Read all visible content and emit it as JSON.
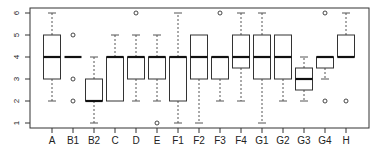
{
  "chart_data": {
    "type": "boxplot",
    "title": "",
    "xlabel": "",
    "ylabel": "",
    "ylim": [
      1,
      6
    ],
    "yticks": [
      1,
      2,
      3,
      4,
      5,
      6
    ],
    "grid": false,
    "legend": null,
    "categories": [
      "A",
      "B1",
      "B2",
      "C",
      "D",
      "E",
      "F1",
      "F2",
      "F3",
      "F4",
      "G1",
      "G2",
      "G3",
      "G4",
      "H"
    ],
    "boxes": [
      {
        "label": "A",
        "whisker_low": 2,
        "q1": 3,
        "median": 4,
        "q3": 5,
        "whisker_high": 6,
        "outliers": []
      },
      {
        "label": "B1",
        "whisker_low": 4,
        "q1": 4,
        "median": 4,
        "q3": 4,
        "whisker_high": 4,
        "outliers": [
          5,
          3,
          2
        ]
      },
      {
        "label": "B2",
        "whisker_low": 1,
        "q1": 2,
        "median": 2,
        "q3": 3,
        "whisker_high": 4,
        "outliers": []
      },
      {
        "label": "C",
        "whisker_low": 2,
        "q1": 2,
        "median": 4,
        "q3": 4,
        "whisker_high": 5,
        "outliers": []
      },
      {
        "label": "D",
        "whisker_low": 2,
        "q1": 3,
        "median": 4,
        "q3": 4,
        "whisker_high": 5,
        "outliers": [
          6
        ]
      },
      {
        "label": "E",
        "whisker_low": 2,
        "q1": 3,
        "median": 4,
        "q3": 4,
        "whisker_high": 5,
        "outliers": [
          1
        ]
      },
      {
        "label": "F1",
        "whisker_low": 1,
        "q1": 2,
        "median": 4,
        "q3": 4,
        "whisker_high": 6,
        "outliers": []
      },
      {
        "label": "F2",
        "whisker_low": 1,
        "q1": 3,
        "median": 4,
        "q3": 5,
        "whisker_high": 5,
        "outliers": []
      },
      {
        "label": "F3",
        "whisker_low": 2,
        "q1": 3,
        "median": 4,
        "q3": 4,
        "whisker_high": 4,
        "outliers": [
          6
        ]
      },
      {
        "label": "F4",
        "whisker_low": 2,
        "q1": 3.5,
        "median": 4,
        "q3": 5,
        "whisker_high": 6,
        "outliers": []
      },
      {
        "label": "G1",
        "whisker_low": 1,
        "q1": 3,
        "median": 4,
        "q3": 5,
        "whisker_high": 6,
        "outliers": []
      },
      {
        "label": "G2",
        "whisker_low": 2,
        "q1": 3,
        "median": 4,
        "q3": 5,
        "whisker_high": 5,
        "outliers": []
      },
      {
        "label": "G3",
        "whisker_low": 2,
        "q1": 2.5,
        "median": 3,
        "q3": 3.5,
        "whisker_high": 4,
        "outliers": []
      },
      {
        "label": "G4",
        "whisker_low": 3,
        "q1": 3.5,
        "median": 4,
        "q3": 4,
        "whisker_high": 4,
        "outliers": [
          2,
          6
        ]
      },
      {
        "label": "H",
        "whisker_low": 4,
        "q1": 4,
        "median": 4,
        "q3": 5,
        "whisker_high": 6,
        "outliers": [
          2
        ]
      }
    ]
  },
  "colors": {
    "axis": "#333333",
    "box": "#333333",
    "median": "#111111",
    "whisker": "#555555",
    "tick_label": "#222222"
  },
  "layout": {
    "plot_left": 30,
    "plot_right": 369,
    "plot_top": 8,
    "plot_bottom": 128,
    "y_px_per_unit": 22,
    "y_at_6": 13,
    "x_first": 52,
    "x_step": 21,
    "box_half_width": 8.5
  }
}
